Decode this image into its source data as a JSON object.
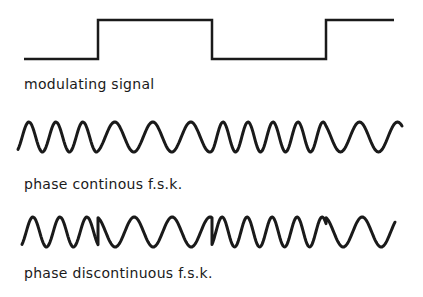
{
  "diagram": {
    "colors": {
      "background": "#ffffff",
      "ink": "#1a1a1a"
    },
    "panels": [
      {
        "id": "modulating",
        "label": "modulating signal",
        "type": "square-wave"
      },
      {
        "id": "continuous",
        "label": "phase continous f.s.k.",
        "type": "sinusoid-phase-continuous"
      },
      {
        "id": "discontinuous",
        "label": "phase discontinuous f.s.k.",
        "type": "sinusoid-phase-discontinuous"
      }
    ]
  }
}
